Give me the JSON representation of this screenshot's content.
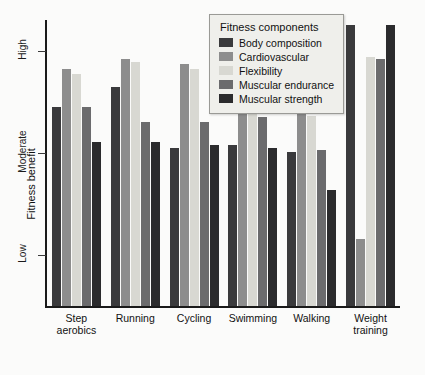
{
  "chart_data": {
    "type": "bar",
    "title": "",
    "xlabel": "",
    "ylabel": "Fitness benefit",
    "grid": false,
    "legend_position": "top-right",
    "legend_title": "Fitness components",
    "categories": [
      "Step\naerobics",
      "Running",
      "Cycling",
      "Swimming",
      "Walking",
      "Weight\ntraining"
    ],
    "ytick_labels": [
      "High",
      "Moderate",
      "Low"
    ],
    "ytick_values": [
      3,
      2,
      1
    ],
    "ylim": [
      0.5,
      3.3
    ],
    "series": [
      {
        "name": "Body composition",
        "color": "#3a3a3c",
        "values": [
          2.45,
          2.64,
          2.05,
          2.08,
          2.01,
          3.25
        ]
      },
      {
        "name": "Cardiovascular",
        "color": "#8d8d8d",
        "values": [
          2.82,
          2.92,
          2.87,
          2.8,
          2.45,
          1.16
        ]
      },
      {
        "name": "Flexibility",
        "color": "#d8d8d2",
        "values": [
          2.77,
          2.89,
          2.82,
          2.75,
          2.36,
          2.94
        ]
      },
      {
        "name": "Muscular endurance",
        "color": "#6b6b6d",
        "values": [
          2.45,
          2.3,
          2.3,
          2.35,
          2.03,
          2.92
        ]
      },
      {
        "name": "Muscular strength",
        "color": "#2b2b2d",
        "values": [
          2.11,
          2.11,
          2.08,
          2.05,
          1.64,
          3.25
        ]
      }
    ]
  }
}
